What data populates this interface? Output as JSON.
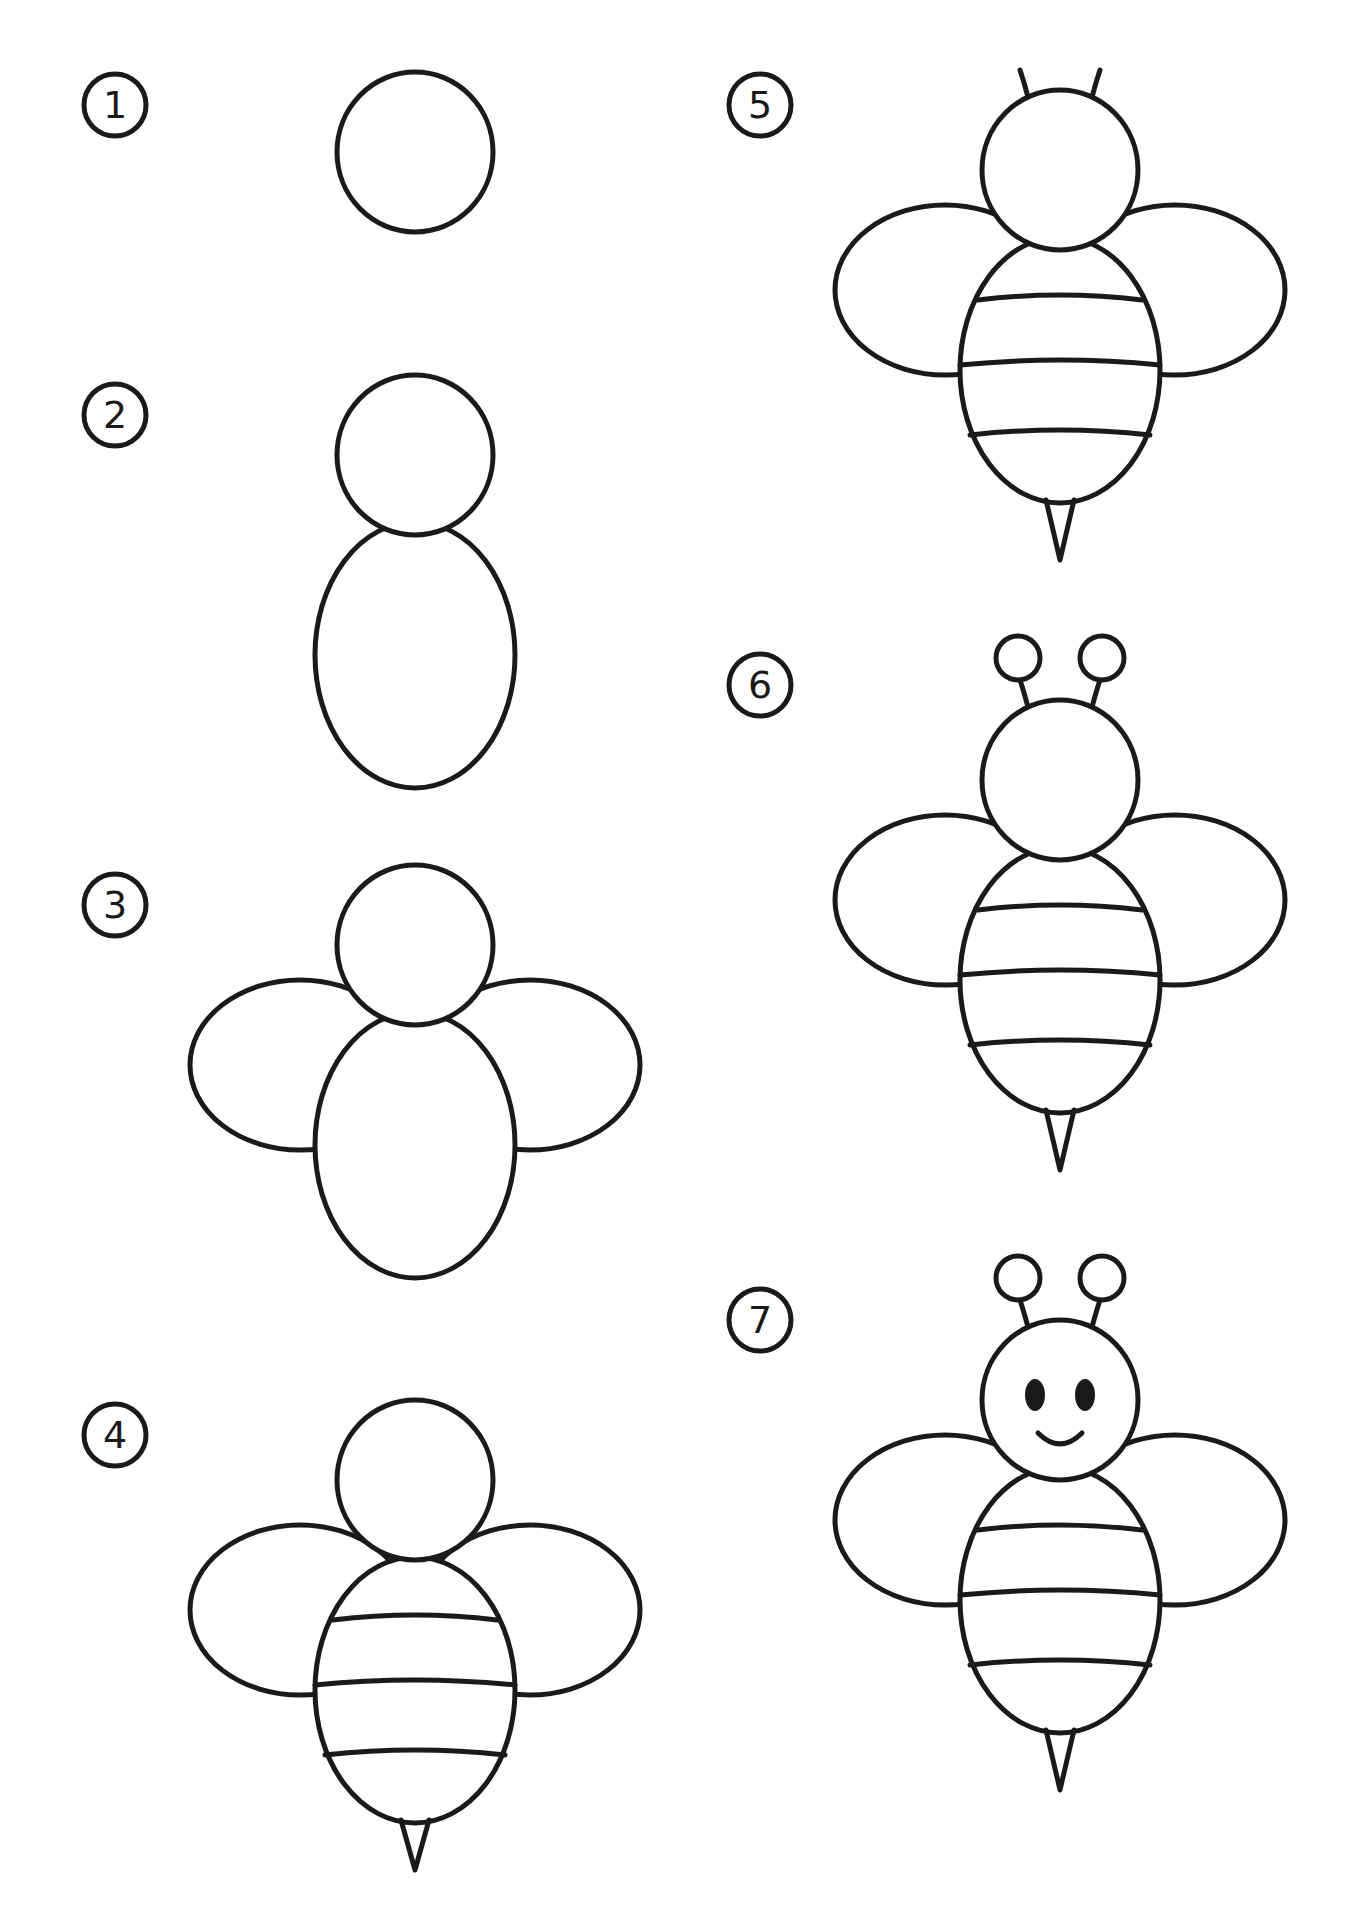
{
  "guide": {
    "subject": "bee",
    "steps": [
      {
        "number": "1"
      },
      {
        "number": "2"
      },
      {
        "number": "3"
      },
      {
        "number": "4"
      },
      {
        "number": "5"
      },
      {
        "number": "6"
      },
      {
        "number": "7"
      }
    ]
  },
  "colors": {
    "line": "#1a1a1a",
    "background": "#ffffff"
  }
}
